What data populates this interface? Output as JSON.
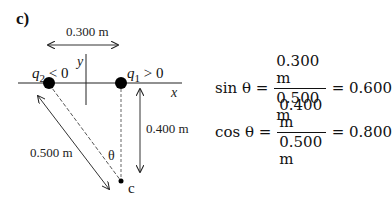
{
  "panel_label": "c)",
  "diagram": {
    "distance_horizontal": "0.300 m",
    "distance_vertical": "0.400 m",
    "distance_diagonal": "0.500 m",
    "charge_negative": {
      "symbol": "q",
      "subscript": "2",
      "condition": " < 0"
    },
    "charge_positive": {
      "symbol": "q",
      "subscript": "1",
      "condition": " > 0"
    },
    "axis_x_label": "x",
    "axis_y_label": "y",
    "angle_label": "θ",
    "point_label": "c"
  },
  "equations": [
    {
      "lhs": "sin θ =",
      "numerator": "0.300 m",
      "denominator": "0.500 m",
      "rhs": "= 0.600"
    },
    {
      "lhs": "cos θ =",
      "numerator": "0.400 m",
      "denominator": "0.500 m",
      "rhs": "= 0.800"
    }
  ]
}
